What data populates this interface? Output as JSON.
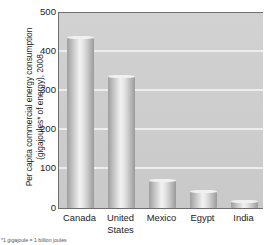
{
  "chart_data": {
    "type": "bar",
    "title": "",
    "xlabel": "",
    "ylabel_line1": "Per capita commercial energy consumption",
    "ylabel_line2": "(gigajoules* of energy), 2008",
    "categories": [
      "Canada",
      "United States",
      "Mexico",
      "Egypt",
      "India"
    ],
    "category_lines": [
      [
        "Canada"
      ],
      [
        "United",
        "States"
      ],
      [
        "Mexico"
      ],
      [
        "Egypt"
      ],
      [
        "India"
      ]
    ],
    "values": [
      438,
      337,
      72,
      44,
      18
    ],
    "ylim": [
      0,
      500
    ],
    "yticks": [
      0,
      100,
      200,
      300,
      400,
      500
    ],
    "ytick_labels": [
      "0",
      "100",
      "200",
      "300",
      "400",
      "500"
    ],
    "grid": true,
    "grid_axis": "y",
    "legend": "none",
    "bar_style": "cylinder-gradient-grayscale",
    "plot_background": "#cfcfcf",
    "gridline_color": "#eeeeee",
    "axis_color": "#6f6f6f",
    "text_color": "#1c1c1c"
  },
  "footnote": {
    "text": "*1 gigajoule = 1 billion joules"
  }
}
